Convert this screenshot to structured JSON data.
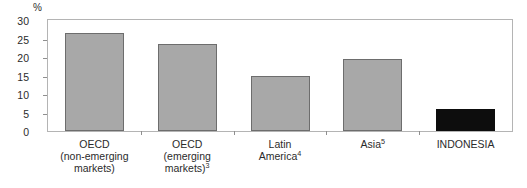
{
  "chart_data": {
    "type": "bar",
    "title": "",
    "subtitle": "",
    "xlabel": "",
    "ylabel": "",
    "unit_label": "%",
    "ylim": [
      0,
      30
    ],
    "yticks": [
      0,
      5,
      10,
      15,
      20,
      25,
      30
    ],
    "ytick_labels": [
      "0",
      "5",
      "10",
      "15",
      "20",
      "25",
      "30"
    ],
    "grid": false,
    "legend": false,
    "categories": [
      "OECD (non-emerging markets)",
      "OECD (emerging markets)3",
      "Latin America4",
      "Asia5",
      "INDONESIA"
    ],
    "values": [
      26.5,
      23.5,
      15.0,
      19.5,
      6.0
    ],
    "bar_colors": [
      "#a8a8a8",
      "#a8a8a8",
      "#a8a8a8",
      "#a8a8a8",
      "#0d0d0d"
    ],
    "bars": [
      {
        "label_lines": [
          "OECD",
          "(non-emerging",
          "markets)"
        ],
        "footnote": "",
        "value": 26.5,
        "color": "#a8a8a8"
      },
      {
        "label_lines": [
          "OECD",
          "(emerging",
          "markets)"
        ],
        "footnote": "3",
        "value": 23.5,
        "color": "#a8a8a8"
      },
      {
        "label_lines": [
          "Latin",
          "America"
        ],
        "footnote": "4",
        "value": 15.0,
        "color": "#a8a8a8"
      },
      {
        "label_lines": [
          "Asia"
        ],
        "footnote": "5",
        "value": 19.5,
        "color": "#a8a8a8"
      },
      {
        "label_lines": [
          "INDONESIA"
        ],
        "footnote": "",
        "value": 6.0,
        "color": "#0d0d0d"
      }
    ]
  },
  "style": {
    "background": "#ffffff",
    "frame_color": "#b4b4b4",
    "text_color": "#2b2b2b",
    "bar_fill_gray": "#a8a8a8",
    "bar_fill_black": "#0d0d0d",
    "bar_edge": "#6d6d6d"
  }
}
